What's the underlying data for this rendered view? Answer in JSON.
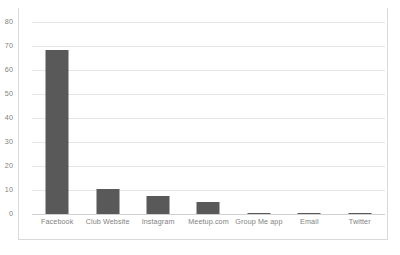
{
  "chart_data": {
    "type": "bar",
    "title": "",
    "subtitle": "",
    "xlabel": "",
    "ylabel": "",
    "categories": [
      "Facebook",
      "Club Website",
      "Instagram",
      "Meetup.com",
      "Group Me app",
      "Email",
      "Twitter"
    ],
    "values": [
      68.5,
      10.5,
      7.3,
      5.2,
      0.5,
      0.4,
      0.4
    ],
    "series": [
      {
        "name": "Responses",
        "values": [
          68.5,
          10.5,
          7.3,
          5.2,
          0.5,
          0.4,
          0.4
        ]
      }
    ],
    "ylim": [
      0,
      80
    ],
    "yticks": [
      0,
      10,
      20,
      30,
      40,
      50,
      60,
      70,
      80
    ],
    "ytick_labels": [
      "0",
      "10",
      "20",
      "30",
      "40",
      "50",
      "60",
      "70",
      "80"
    ],
    "grid": true,
    "grid_axis": "y",
    "legend": false,
    "legend_position": "none",
    "annotations": []
  },
  "style": {
    "bar_color": "#595959",
    "gridline_color": "#e6e6e6",
    "baseline_color": "#d0d0d0",
    "tick_label_color": "#7f7f7f",
    "frame_color": "#d9d9d9",
    "background": "#ffffff"
  }
}
